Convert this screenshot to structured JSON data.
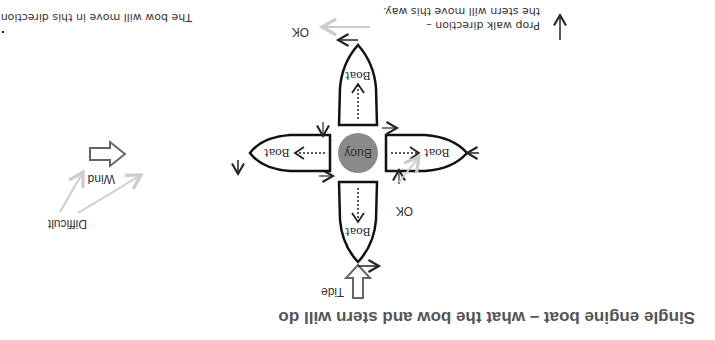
{
  "title": "Single engine boat – what the bow and stern will do",
  "labels": {
    "tide": "Tide",
    "wind": "Wind",
    "difficult": "Difficult",
    "ok_left": "OK",
    "ok_bottom": "OK",
    "buoy": "Buoy",
    "boat_top": "Boat",
    "boat_left": "Boat",
    "boat_right": "Boat",
    "boat_bottom": "Boat"
  },
  "notes": {
    "prop_walk_line1": "Prop walk direction –",
    "prop_walk_line2": "the stern will move this way.",
    "bow_move": "The bow will move in this direction."
  },
  "colors": {
    "buoy": "#8a8a8a",
    "outline": "#111111",
    "hint_arrow": "#cccccc",
    "big_arrow": "#666666"
  }
}
